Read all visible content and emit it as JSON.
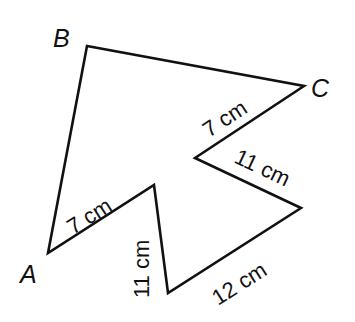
{
  "diagram": {
    "type": "polygon",
    "stroke_color": "#111111",
    "background": "#ffffff",
    "vertices": [
      {
        "name": "A",
        "x": 48,
        "y": 253,
        "label": "A"
      },
      {
        "name": "B",
        "x": 87,
        "y": 46,
        "label": "B"
      },
      {
        "name": "C",
        "x": 304,
        "y": 86,
        "label": "C"
      },
      {
        "name": "D",
        "x": 195,
        "y": 158,
        "label": ""
      },
      {
        "name": "E",
        "x": 301,
        "y": 208,
        "label": ""
      },
      {
        "name": "F",
        "x": 168,
        "y": 293,
        "label": ""
      },
      {
        "name": "G",
        "x": 154,
        "y": 185,
        "label": ""
      }
    ],
    "edge_labels": {
      "cd": "7 cm",
      "de": "11 cm",
      "ef": "12 cm",
      "fg": "11 cm",
      "ga": "7 cm"
    },
    "vertex_labels": {
      "a": "A",
      "b": "B",
      "c": "C"
    }
  }
}
